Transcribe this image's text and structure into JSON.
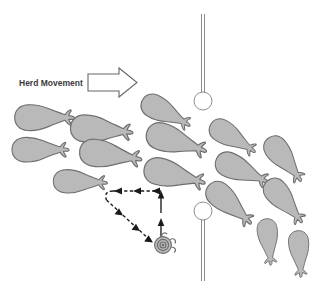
{
  "figure": {
    "background_color": "#ffffff",
    "width": 323,
    "height": 284
  },
  "annotations": {
    "herd_movement_label": "Herd Movement",
    "herd_movement_arrow_direction": "right"
  },
  "colors": {
    "whale_fill": "#b9b9b9",
    "whale_outline": "#6e6e6e",
    "pin_stroke": "#8e8e8e",
    "path_stroke": "#1a1a1a",
    "arrow_outline": "#666666",
    "label_text": "#3b3b3b"
  },
  "icons": {
    "herd_movement_arrow": "block-arrow-right-icon",
    "vessel": "spiral-vessel-icon",
    "marker_top": "pin-marker-icon",
    "marker_bottom": "pin-marker-icon"
  },
  "whales": [
    {
      "id": 1,
      "x": 42,
      "y": 118,
      "rotation": 0,
      "scale": 1.05
    },
    {
      "id": 2,
      "x": 99,
      "y": 130,
      "rotation": 5,
      "scale": 1.1
    },
    {
      "id": 3,
      "x": 38,
      "y": 150,
      "rotation": 0,
      "scale": 1.0
    },
    {
      "id": 4,
      "x": 108,
      "y": 155,
      "rotation": 8,
      "scale": 1.1
    },
    {
      "id": 5,
      "x": 78,
      "y": 182,
      "rotation": 2,
      "scale": 0.95
    },
    {
      "id": 6,
      "x": 164,
      "y": 112,
      "rotation": 28,
      "scale": 0.95
    },
    {
      "id": 7,
      "x": 174,
      "y": 141,
      "rotation": 18,
      "scale": 1.1
    },
    {
      "id": 8,
      "x": 172,
      "y": 175,
      "rotation": 14,
      "scale": 1.1
    },
    {
      "id": 9,
      "x": 231,
      "y": 137,
      "rotation": 32,
      "scale": 0.92
    },
    {
      "id": 10,
      "x": 240,
      "y": 170,
      "rotation": 24,
      "scale": 1.0
    },
    {
      "id": 11,
      "x": 228,
      "y": 203,
      "rotation": 42,
      "scale": 1.0
    },
    {
      "id": 12,
      "x": 283,
      "y": 158,
      "rotation": 52,
      "scale": 0.95
    },
    {
      "id": 13,
      "x": 283,
      "y": 200,
      "rotation": 50,
      "scale": 0.95
    },
    {
      "id": 14,
      "x": 268,
      "y": 240,
      "rotation": 84,
      "scale": 0.82
    },
    {
      "id": 15,
      "x": 299,
      "y": 252,
      "rotation": 86,
      "scale": 0.82
    }
  ],
  "markers": [
    {
      "id": "marker-top",
      "line_x": 203,
      "line_y1": 14,
      "line_y2": 93,
      "circle_cx": 203,
      "circle_cy": 101,
      "circle_r": 9
    },
    {
      "id": "marker-bottom",
      "line_x": 203,
      "line_y1": 219,
      "line_y2": 280,
      "circle_cx": 203,
      "circle_cy": 211,
      "circle_r": 9
    }
  ],
  "vessel": {
    "label": "vessel",
    "cx": 163,
    "cy": 245,
    "r_outer": 9
  },
  "vessel_track": {
    "description": "Dashed survey track with arrowheads plus solid vertical approach arrows",
    "segments": [
      {
        "type": "dashed-horizontal",
        "from_x": 161,
        "from_y": 191,
        "to_x": 111,
        "to_y": 191,
        "direction": "left"
      },
      {
        "type": "dashed-curve",
        "from_x": 111,
        "from_y": 191,
        "to_x": 107,
        "to_y": 200,
        "direction": "down-left"
      },
      {
        "type": "dashed-diagonal",
        "from_x": 107,
        "from_y": 200,
        "to_x": 152,
        "to_y": 241,
        "direction": "down-right"
      },
      {
        "type": "solid-vertical",
        "from_x": 161,
        "from_y": 240,
        "to_x": 161,
        "to_y": 193,
        "direction": "up"
      }
    ],
    "arrowhead_count": 6
  }
}
